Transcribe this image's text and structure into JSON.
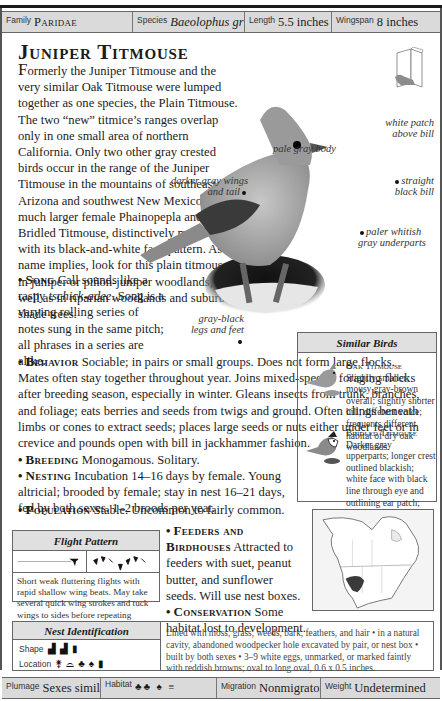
{
  "top_bar": {
    "family_label": "Family",
    "family_value": "Paridae",
    "species_label": "Species",
    "species_value": "Baeolophus griseus",
    "length_label": "Length",
    "length_value": "5.5 inches",
    "wingspan_label": "Wingspan",
    "wingspan_value": "8 inches"
  },
  "title": "Juniper Titmouse",
  "intro": {
    "dropcap": "F",
    "text": "ormerly the Juniper Titmouse and the very similar Oak Titmouse were lumped together as one species, the Plain Titmouse. The two “new” titmice’s ranges overlap only in one small area of northern California. Only two other gray crested birds occur in the range of the Juniper Titmouse in the mountains of southeast Arizona and southwest New Mexico: the much larger female Phainopepla and the Bridled Titmouse, distinctively marked with its black-and-white face pattern. As its name implies, look for this plain titmouse in juniper or piñon-juniper woodlands, as well as in riparian woodlands and suburban shade trees."
  },
  "callouts": {
    "pale_gray_body": "pale gray body",
    "darker_gray_wings": "darker gray wings and tail",
    "white_patch": "white patch above bill",
    "straight_bill": "straight black bill",
    "underparts": "paler whitish gray underparts",
    "legs": "gray-black legs and feet"
  },
  "sections": {
    "song": {
      "heading": "Song",
      "text_before": "Call sounds like a raspy ",
      "call": "tschick-adee",
      "text_after": ". Song is a varying rolling series of notes sung in the same pitch; all phrases in a series are alike."
    },
    "behavior": {
      "heading": "Behavior",
      "text": "Sociable; in pairs or small groups. Does not form large flocks. Mates often stay together throughout year. Joins mixed-species foraging flocks after breeding season, especially in winter. Gleans insects from trunk, branches, and foliage; eats berries and seeds from twigs and ground. Often clings beneath limbs or cones to extract seeds; places large seeds or nuts either under feet or in crevice and pounds open with bill in jackhammer fashion."
    },
    "breeding": {
      "heading": "Breeding",
      "text": "Monogamous. Solitary."
    },
    "nesting": {
      "heading": "Nesting",
      "text": "Incubation 14–16 days by female. Young altricial; brooded by female; stay in nest 16–21 days, fed by both sexes. 1–2 broods per year."
    },
    "population": {
      "heading": "Population",
      "text": "Stable. Uncommon to fairly common."
    },
    "feeders": {
      "heading": "Feeders and Birdhouses",
      "text": "Attracted to feeders with suet, peanut butter, and sunflower seeds. Will use nest boxes."
    },
    "conservation": {
      "heading": "Conservation",
      "text": "Some habitat lost to development."
    }
  },
  "similar_birds": {
    "header": "Similar Birds",
    "items": [
      {
        "name": "Oak Titmouse",
        "text": "Slightly smaller; mousy gray-brown overall; slightly shorter bill; different voice; frequents different habitat of dry oak woodlands."
      },
      {
        "name": "Bridled Titmouse",
        "text": "Darker gray upperparts; longer crest outlined blackish; white face with black line through eye and outlining ear patch; black bib."
      }
    ]
  },
  "flight_pattern": {
    "header": "Flight Pattern",
    "description": "Short weak fluttering flights with rapid shallow wing beats. May take several quick wing strokes and tuck wings to sides before repeating another series of strokes."
  },
  "nest_identification": {
    "header": "Nest Identification",
    "shape_label": "Shape",
    "location_label": "Location",
    "description": "Lined with moss, grass, weeds, bark, feathers, and hair • in a natural cavity, abandoned woodpecker hole excavated by pair, or nest box • built by both sexes • 3–9 white eggs, unmarked, or marked faintly with reddish browns; oval to long oval, 0.6 x 0.5 inches."
  },
  "bottom_bar": {
    "plumage_label": "Plumage",
    "plumage_value": "Sexes similar",
    "habitat_label": "Habitat",
    "migration_label": "Migration",
    "migration_value": "Nonmigratory",
    "weight_label": "Weight",
    "weight_value": "Undetermined"
  },
  "colors": {
    "bar_bg": "#dadada",
    "box_header_bg": "#e0e0e0",
    "range_fill": "#3a3a3a"
  }
}
